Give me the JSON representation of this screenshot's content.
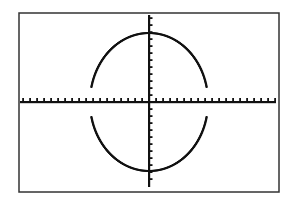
{
  "chart_data": {
    "type": "line",
    "title": "",
    "xlabel": "",
    "ylabel": "",
    "series": [
      {
        "name": "upper-semicircle",
        "equation": "y = sqrt(r^2 - x^2)"
      },
      {
        "name": "lower-semicircle",
        "equation": "y = -sqrt(r^2 - x^2)"
      }
    ],
    "x_radius_ticks": 8.4,
    "y_radius_ticks": 9.8,
    "tick_spacing_units": 1,
    "grid": false,
    "legend": "none",
    "axes": {
      "x_ticks": true,
      "y_ticks": true
    }
  },
  "layout": {
    "frame": {
      "left": 19,
      "top": 13,
      "right": 279,
      "bottom": 192
    },
    "origin": {
      "x": 149,
      "y": 102
    },
    "tick_px": 7,
    "rx_px": 59,
    "ry_px": 69,
    "gap_px": 15,
    "colors": {
      "ink": "#111111",
      "frame": "#333333",
      "background": "#ffffff"
    }
  }
}
